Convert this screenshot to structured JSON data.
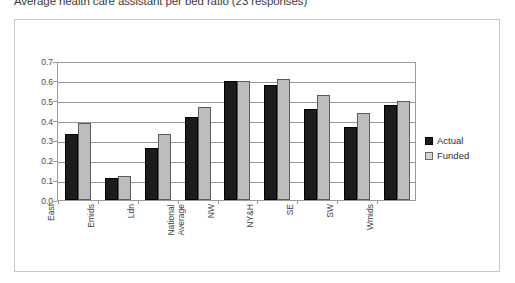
{
  "caption": "Average health care assistant per bed ratio (23 responses)",
  "legend": {
    "position": "right",
    "entries": [
      {
        "label": "Actual",
        "color": "#1c1c1c",
        "icon": "square-swatch-icon"
      },
      {
        "label": "Funded",
        "color": "#d4d4d4",
        "icon": "square-swatch-icon"
      }
    ]
  },
  "axis": {
    "y_ticks": [
      "0.7",
      "0.6",
      "0.5",
      "0.4",
      "0.3",
      "0.2",
      "0.1",
      "0.0"
    ],
    "x_labels": [
      "East",
      "Emids",
      "Ldn",
      "National\nAverage",
      "NW",
      "NY&H",
      "SE",
      "SW",
      "Wmids"
    ]
  },
  "chart_data": {
    "type": "bar",
    "title": "Average health care assistant per bed ratio (23 responses)",
    "xlabel": "",
    "ylabel": "",
    "ylim": [
      0.0,
      0.7
    ],
    "ytick_step": 0.1,
    "grid": true,
    "legend_position": "right",
    "categories": [
      "East",
      "Emids",
      "Ldn",
      "National Average",
      "NW",
      "NY&H",
      "SE",
      "SW",
      "Wmids"
    ],
    "series": [
      {
        "name": "Actual",
        "color": "#1c1c1c",
        "values": [
          0.33,
          0.11,
          0.26,
          0.42,
          0.6,
          0.58,
          0.46,
          0.37,
          0.48
        ]
      },
      {
        "name": "Funded",
        "color": "#bdbdbd",
        "values": [
          0.39,
          0.12,
          0.33,
          0.47,
          0.6,
          0.61,
          0.53,
          0.44,
          0.5
        ]
      }
    ]
  }
}
